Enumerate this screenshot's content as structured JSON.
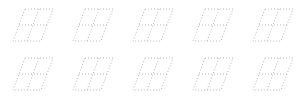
{
  "rows": [
    {
      "digits": [
        {
          "label": "1"
        },
        {
          "label": "2"
        },
        {
          "label": "3"
        },
        {
          "label": "4"
        },
        {
          "label": "5"
        }
      ]
    },
    {
      "digits": [
        {
          "label": "6"
        },
        {
          "label": "7"
        },
        {
          "label": "8"
        },
        {
          "label": "9"
        },
        {
          "label": "0"
        }
      ]
    }
  ],
  "colors": {
    "ink": "#111111",
    "guide": "#b8b8b8",
    "background": "#ffffff"
  }
}
